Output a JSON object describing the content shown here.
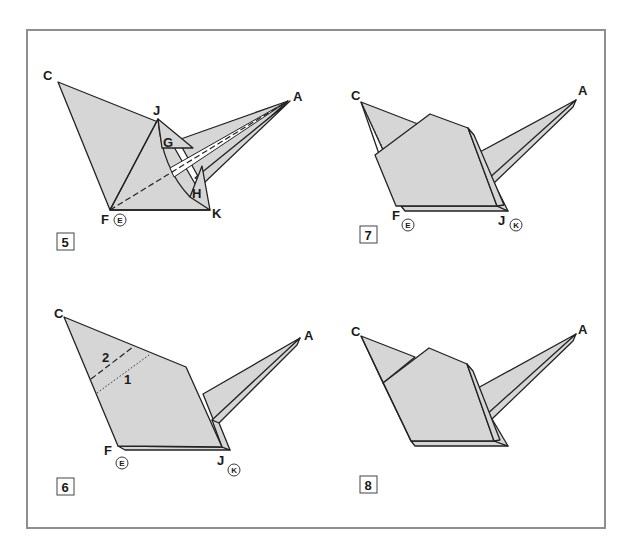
{
  "figure": {
    "type": "origami-instruction-diagram",
    "frame_color": "#8e8e8e",
    "paper_color": "#d6d6d6",
    "line_color": "#222222"
  },
  "steps": [
    {
      "number": "5",
      "points": {
        "C": "C",
        "J": "J",
        "G": "G",
        "A": "A",
        "H": "H",
        "F": "F",
        "K": "K"
      },
      "circled": {
        "E": "E"
      }
    },
    {
      "number": "6",
      "points": {
        "C": "C",
        "A": "A",
        "F": "F",
        "J": "J"
      },
      "circled": {
        "E": "E",
        "K": "K"
      },
      "fold_labels": {
        "first": "1",
        "second": "2"
      }
    },
    {
      "number": "7",
      "points": {
        "C": "C",
        "A": "A",
        "F": "F",
        "J": "J"
      },
      "circled": {
        "E": "E",
        "K": "K"
      }
    },
    {
      "number": "8",
      "points": {
        "C": "C",
        "A": "A"
      }
    }
  ]
}
